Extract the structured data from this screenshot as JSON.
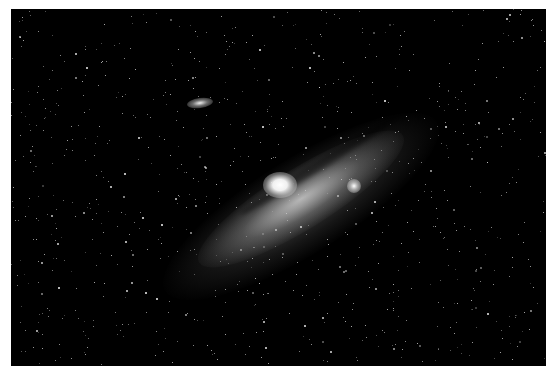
{
  "image": {
    "subject": "Andromeda galaxy",
    "description": "Spiral galaxy photographed against a dense star field, with two satellite galaxies",
    "background_color": "#000000",
    "border_color": "#ffffff"
  }
}
